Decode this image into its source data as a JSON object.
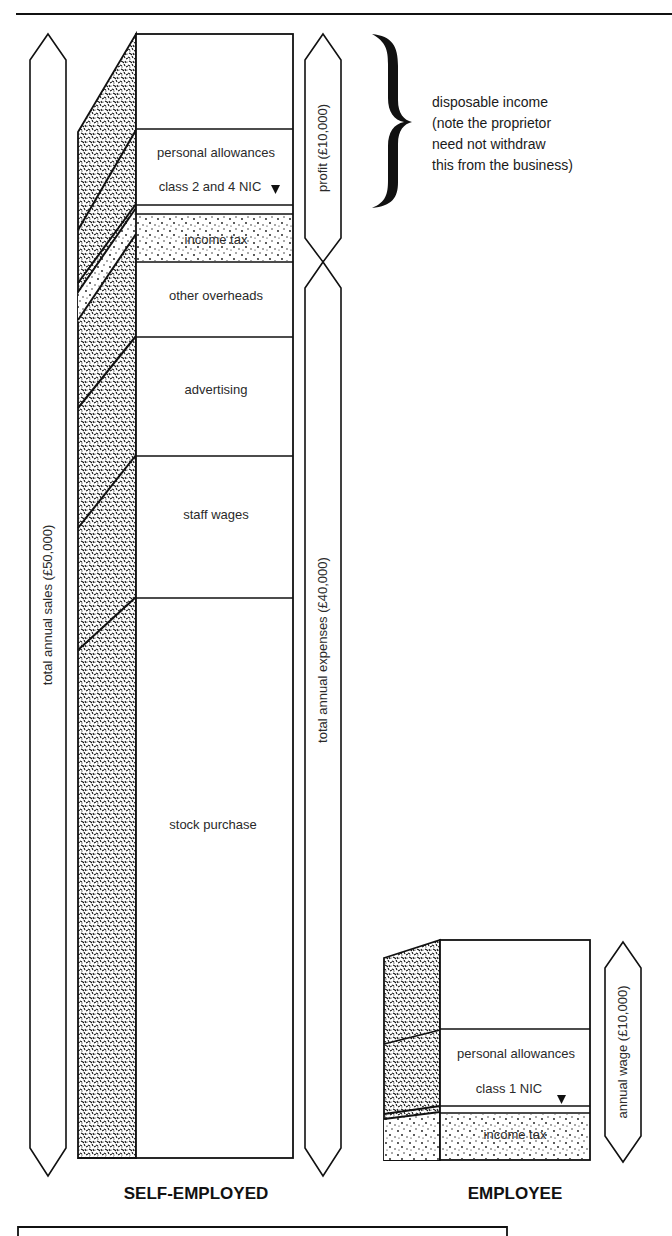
{
  "self_employed": {
    "title": "SELF-EMPLOYED",
    "total_sales_label": "total annual sales (£50,000)",
    "total_expenses_label": "total annual expenses (£40,000)",
    "profit_label": "profit (£10,000)",
    "segments": [
      {
        "key": "untaxed",
        "label": ""
      },
      {
        "key": "personal_allowances",
        "label": "personal allowances"
      },
      {
        "key": "nic",
        "label": "class 2 and 4 NIC"
      },
      {
        "key": "income_tax",
        "label": "income tax"
      },
      {
        "key": "other_overheads",
        "label": "other overheads"
      },
      {
        "key": "advertising",
        "label": "advertising"
      },
      {
        "key": "staff_wages",
        "label": "staff wages"
      },
      {
        "key": "stock_purchase",
        "label": "stock purchase"
      }
    ]
  },
  "employee": {
    "title": "EMPLOYEE",
    "wage_label": "annual wage (£10,000)",
    "segments": [
      {
        "key": "untaxed",
        "label": ""
      },
      {
        "key": "personal_allowances",
        "label": "personal allowances"
      },
      {
        "key": "nic",
        "label": "class 1 NIC"
      },
      {
        "key": "income_tax",
        "label": "income tax"
      }
    ]
  },
  "annotation": {
    "lines": [
      "disposable income",
      "(note the proprietor",
      "need not withdraw",
      "this from the business)"
    ]
  },
  "colors": {
    "ink": "#1a1a1a",
    "paper": "#ffffff"
  }
}
